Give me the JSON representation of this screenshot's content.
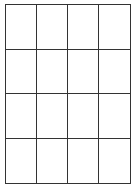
{
  "grid": {
    "rows": 4,
    "columns": 4,
    "line_color": "#333333",
    "background": "#ffffff",
    "cells": [
      [
        "",
        "",
        "",
        ""
      ],
      [
        "",
        "",
        "",
        ""
      ],
      [
        "",
        "",
        "",
        ""
      ],
      [
        "",
        "",
        "",
        ""
      ]
    ]
  }
}
